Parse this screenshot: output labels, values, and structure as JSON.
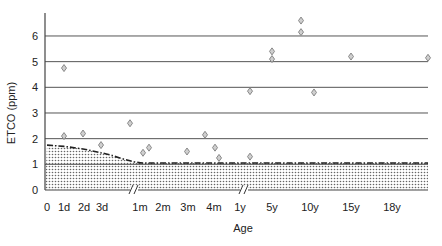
{
  "chart_data": {
    "type": "scatter",
    "title": "",
    "xlabel": "Age",
    "ylabel": "ETCO (ppm)",
    "ylim": [
      0,
      7
    ],
    "y_ticks": [
      "0",
      "1",
      "2",
      "3",
      "4",
      "5",
      "6"
    ],
    "x_ticks": [
      "0",
      "1d",
      "2d",
      "3d",
      "1m",
      "2m",
      "3m",
      "4m",
      "1y",
      "5y",
      "10y",
      "15y",
      "18y"
    ],
    "x_axis_breaks": [
      "between 3d and 1m",
      "between 4m and 1y"
    ],
    "grid": "horizontal",
    "legend": "none",
    "colors": {
      "marker": "#888888",
      "line": "#222222",
      "grid": "#555555",
      "fill_dots": "#777777"
    },
    "reference_curve": {
      "name": "normal range upper limit",
      "style": "dash-dot, shaded below",
      "points": [
        {
          "x": "0",
          "y": 1.75
        },
        {
          "x": "1d",
          "y": 1.7
        },
        {
          "x": "2d",
          "y": 1.6
        },
        {
          "x": "3d",
          "y": 1.45
        },
        {
          "x": "1m",
          "y": 1.05
        },
        {
          "x": "18y",
          "y": 1.05
        },
        {
          "x": "end",
          "y": 1.05
        }
      ]
    },
    "series": [
      {
        "name": "patients",
        "marker": "diamond",
        "points": [
          {
            "x": "1d",
            "y": 4.75
          },
          {
            "x": "1d",
            "y": 2.1
          },
          {
            "x": "2d",
            "y": 2.2
          },
          {
            "x": "3d",
            "y": 1.75
          },
          {
            "x": "<1m",
            "y": 2.6
          },
          {
            "x": "1m",
            "y": 1.45
          },
          {
            "x": "1m",
            "y": 1.65
          },
          {
            "x": "3m",
            "y": 1.5
          },
          {
            "x": "4m",
            "y": 2.15
          },
          {
            "x": "4m",
            "y": 1.65
          },
          {
            "x": "4m",
            "y": 1.25
          },
          {
            "x": "1y",
            "y": 3.85
          },
          {
            "x": "1y",
            "y": 1.3
          },
          {
            "x": "5y",
            "y": 5.4
          },
          {
            "x": "5y",
            "y": 5.1
          },
          {
            "x": "10y",
            "y": 6.6
          },
          {
            "x": "10y",
            "y": 6.15
          },
          {
            "x": "10y+",
            "y": 3.8
          },
          {
            "x": "15y",
            "y": 5.2
          },
          {
            "x": ">18y",
            "y": 5.15
          }
        ]
      }
    ]
  }
}
